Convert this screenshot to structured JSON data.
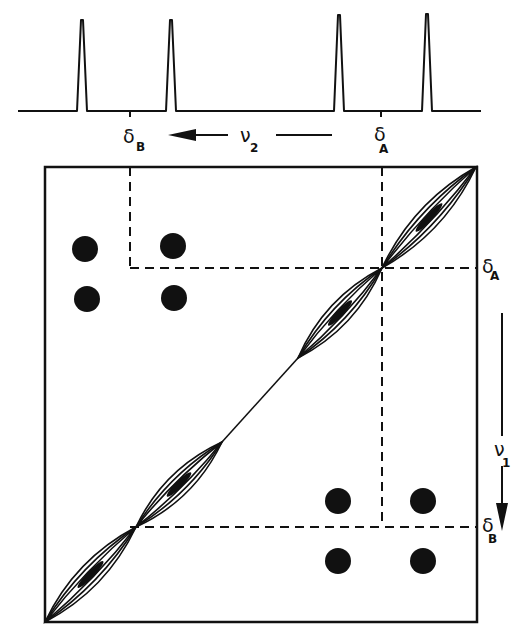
{
  "diagram": {
    "ink_color": "#111111",
    "background": "#ffffff"
  },
  "spectrum_1d": {
    "axis_label": "ν",
    "axis_subscript": "2",
    "baseline_y": 111,
    "x_range": [
      18,
      481
    ],
    "peaks": [
      {
        "x": 82,
        "height": 91
      },
      {
        "x": 171,
        "height": 91
      },
      {
        "x": 339,
        "height": 96
      },
      {
        "x": 427,
        "height": 97
      }
    ],
    "markers": [
      {
        "id": "delta-B",
        "symbol": "δ",
        "subscript": "B",
        "x": 130
      },
      {
        "id": "delta-A",
        "symbol": "δ",
        "subscript": "A",
        "x": 381
      }
    ]
  },
  "contour_plot": {
    "frame": {
      "left": 45,
      "top": 167,
      "right": 477,
      "bottom": 622
    },
    "axis_label": "ν",
    "axis_subscript": "1",
    "chemical_shifts": [
      {
        "id": "delta-A",
        "symbol": "δ",
        "subscript": "A",
        "x": 382,
        "y": 268
      },
      {
        "id": "delta-B",
        "symbol": "δ",
        "subscript": "B",
        "x": 130,
        "y": 527
      }
    ],
    "diagonal_peaks": [
      {
        "from": [
          45,
          622
        ],
        "to": [
          136,
          527
        ]
      },
      {
        "from": [
          136,
          527
        ],
        "to": [
          222,
          442
        ]
      },
      {
        "from": [
          298,
          358
        ],
        "to": [
          382,
          268
        ]
      },
      {
        "from": [
          382,
          268
        ],
        "to": [
          476,
          167
        ]
      }
    ],
    "cross_peaks": [
      {
        "x": 85,
        "y": 249
      },
      {
        "x": 173,
        "y": 246
      },
      {
        "x": 87,
        "y": 299
      },
      {
        "x": 174,
        "y": 298
      },
      {
        "x": 338,
        "y": 501
      },
      {
        "x": 423,
        "y": 501
      },
      {
        "x": 338,
        "y": 561
      },
      {
        "x": 423,
        "y": 561
      }
    ]
  }
}
